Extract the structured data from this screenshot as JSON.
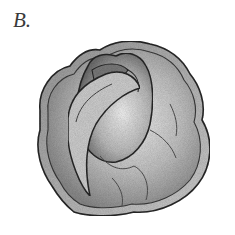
{
  "figure": {
    "panel_label": "B.",
    "colors": {
      "background": "#ffffff",
      "outline": "#2b2b2b",
      "shade_dark": "#6e6e6e",
      "shade_mid": "#a8a8a8",
      "shade_light": "#dedede"
    }
  }
}
